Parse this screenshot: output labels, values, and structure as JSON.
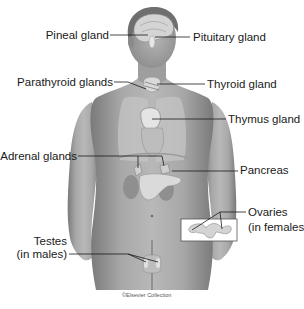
{
  "figure": {
    "credit": "©Elsevier Collection",
    "labels": {
      "pineal": "Pineal gland",
      "pituitary": "Pituitary gland",
      "parathyroid": "Parathyroid glands",
      "thyroid": "Thyroid gland",
      "thymus": "Thymus gland",
      "adrenal": "Adrenal glands",
      "pancreas": "Pancreas",
      "ovaries_line1": "Ovaries",
      "ovaries_line2": "(in females)",
      "testes_line1": "Testes",
      "testes_line2": "(in males)"
    },
    "colors": {
      "skin": "#a9a9a9",
      "skin_dark": "#7d7d7d",
      "organ": "#d9d9d9",
      "lung": "#c8c8c8",
      "line": "#1a1a1a",
      "background": "#ffffff"
    }
  }
}
